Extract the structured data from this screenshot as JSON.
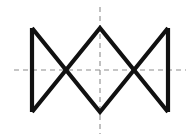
{
  "figure": {
    "kind": "line-drawing",
    "canvas": {
      "width": 192,
      "height": 137,
      "background": "#ffffff"
    },
    "stroke": {
      "color": "#111111",
      "width": 4.2,
      "linecap": "butt",
      "linejoin": "miter"
    },
    "centerline": {
      "color": "#8d8d8d",
      "width": 1.1,
      "dash": "5,4",
      "horizontal": {
        "y": 70,
        "x_start": 14,
        "x_end": 186
      },
      "vertical": {
        "x": 100,
        "y_start": 7,
        "y_end": 134
      }
    },
    "geometry": {
      "top_y": 28,
      "bottom_y": 112,
      "mid_y": 70,
      "left_x": 32,
      "right_x": 168,
      "center_x": 100,
      "cross_left_x": 68,
      "cross_right_x": 133
    },
    "paths": {
      "left_vertical": "M 32 28 L 32 112",
      "right_vertical": "M 168 28 L 168 112",
      "zigzag_upper": "M 32 28 L 100 112 L 168 28",
      "zigzag_lower": "M 32 112 L 100 28 L 168 112"
    },
    "vertices": [
      {
        "name": "top-left",
        "x": 32,
        "y": 28
      },
      {
        "name": "bottom-left",
        "x": 32,
        "y": 112
      },
      {
        "name": "center-top-apex",
        "x": 100,
        "y": 28
      },
      {
        "name": "center-bottom-apex",
        "x": 100,
        "y": 112
      },
      {
        "name": "top-right",
        "x": 168,
        "y": 28
      },
      {
        "name": "bottom-right",
        "x": 168,
        "y": 112
      },
      {
        "name": "left-crossing",
        "x": 68,
        "y": 70
      },
      {
        "name": "right-crossing",
        "x": 133,
        "y": 70
      }
    ]
  }
}
